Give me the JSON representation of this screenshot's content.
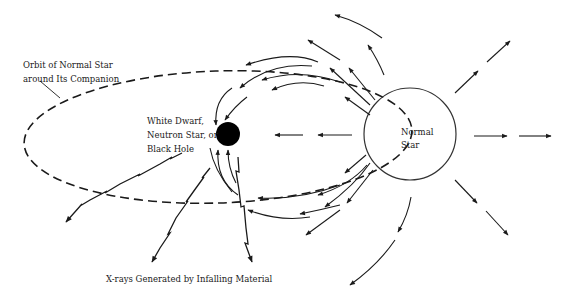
{
  "diagram": {
    "labels": {
      "orbit": [
        "Orbit of Normal Star",
        "around Its Companion"
      ],
      "compact_object": [
        "White Dwarf,",
        "Neutron Star, or",
        "Black Hole"
      ],
      "normal_star": [
        "Normal",
        "Star"
      ],
      "xrays": "X-rays Generated by Infalling Material"
    },
    "elements": {
      "orbit": {
        "shape": "dashed-ellipse",
        "cx": 218,
        "cy": 138,
        "rx": 194,
        "ry": 64
      },
      "compact_object": {
        "shape": "filled-circle",
        "cx": 228,
        "cy": 134,
        "r": 12,
        "color": "#000000"
      },
      "normal_star": {
        "shape": "circle",
        "cx": 410,
        "cy": 134,
        "r": 46,
        "color": "#333333"
      },
      "xray_rays": 3,
      "outflow_arrows_right": 3,
      "infall_arrows": "curved streams from normal star to compact object"
    },
    "colors": {
      "ink": "#1a1a1a",
      "background": "#ffffff"
    }
  }
}
